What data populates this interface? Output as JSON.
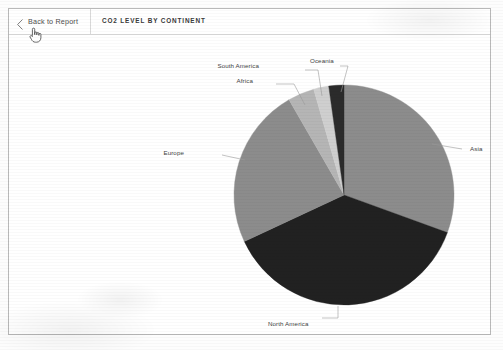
{
  "header": {
    "back_button_label": "Back to Report",
    "back_icon": "chevron-left-icon",
    "title": "CO2 LEVEL BY CONTINENT"
  },
  "cursor": {
    "icon": "pointing-hand-cursor"
  },
  "chart_data": {
    "type": "pie",
    "title": "CO2 LEVEL BY CONTINENT",
    "xlabel": "",
    "ylabel": "",
    "legend_position": "none",
    "grid": false,
    "labels": [
      "Asia",
      "North America",
      "Europe",
      "Africa",
      "South America",
      "Oceania"
    ],
    "values": [
      30.6,
      37.5,
      23.6,
      3.9,
      2.2,
      2.2
    ],
    "unit": "percent",
    "start_angle_deg": 0,
    "direction": "clockwise",
    "colors": [
      "#8c8c8c",
      "#212121",
      "#8c8c8c",
      "#b5b5b5",
      "#cfcfcf",
      "#2b2b2b"
    ],
    "slices": [
      {
        "label": "Asia",
        "value": 30.6,
        "color": "#8c8c8c",
        "start_deg": 0.0,
        "end_deg": 110.0,
        "label_x": 470,
        "label_y": 150,
        "anchor": "start",
        "leader": [
          [
            432,
            144
          ],
          [
            462,
            149
          ]
        ]
      },
      {
        "label": "North America",
        "value": 37.5,
        "color": "#212121",
        "start_deg": 110.0,
        "end_deg": 245.0,
        "label_x": 268,
        "label_y": 325,
        "anchor": "start",
        "leader": [
          [
            338,
            306
          ],
          [
            338,
            318
          ],
          [
            322,
            318
          ]
        ]
      },
      {
        "label": "Europe",
        "value": 23.6,
        "color": "#8c8c8c",
        "start_deg": 245.0,
        "end_deg": 330.0,
        "label_x": 184,
        "label_y": 154,
        "anchor": "end",
        "leader": [
          [
            245,
            160
          ],
          [
            222,
            155
          ]
        ]
      },
      {
        "label": "Africa",
        "value": 3.9,
        "color": "#b5b5b5",
        "start_deg": 330.0,
        "end_deg": 344.0,
        "label_x": 253,
        "label_y": 82,
        "anchor": "end",
        "leader": [
          [
            305,
            105
          ],
          [
            294,
            84
          ],
          [
            276,
            84
          ]
        ]
      },
      {
        "label": "South America",
        "value": 2.2,
        "color": "#cfcfcf",
        "start_deg": 344.0,
        "end_deg": 352.0,
        "label_x": 259,
        "label_y": 67,
        "anchor": "end",
        "leader": [
          [
            322,
            96
          ],
          [
            318,
            70
          ],
          [
            305,
            70
          ]
        ]
      },
      {
        "label": "Oceania",
        "value": 2.2,
        "color": "#2b2b2b",
        "start_deg": 352.0,
        "end_deg": 360.0,
        "label_x": 310,
        "label_y": 62,
        "anchor": "start",
        "leader": [
          [
            341,
            92
          ],
          [
            348,
            66
          ],
          [
            340,
            66
          ]
        ]
      }
    ],
    "geometry": {
      "cx": 344,
      "cy": 195,
      "r": 110
    }
  },
  "style": {
    "background": "#ffffff",
    "border_color": "#b9b9b9",
    "text_color": "#3f3f3f",
    "divider_color": "#d9d9d9"
  }
}
